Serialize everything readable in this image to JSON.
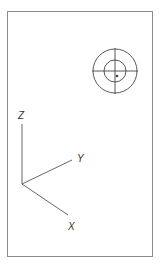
{
  "viewport": {
    "border_color": "#8a8a8a",
    "background": "#ffffff"
  },
  "target": {
    "center": [
      115,
      71
    ],
    "outer_radius": 22,
    "inner_radius": 11,
    "marker": [
      117,
      76
    ],
    "stroke": "#444444"
  },
  "axes": {
    "origin": [
      22,
      184
    ],
    "stroke": "#555555",
    "labels": {
      "x": "X",
      "y": "Y",
      "z": "Z"
    }
  }
}
